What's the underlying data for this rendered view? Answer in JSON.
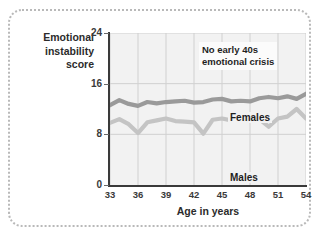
{
  "chart_data": {
    "type": "line",
    "title": "",
    "xlabel": "Age in years",
    "ylabel": "Emotional instability score",
    "ylabel_lines": [
      "Emotional",
      "instability",
      "score"
    ],
    "xlim": [
      33,
      54
    ],
    "ylim": [
      0,
      24
    ],
    "yticks": [
      0,
      8,
      16,
      24
    ],
    "xticks": [
      33,
      36,
      39,
      42,
      45,
      48,
      51,
      54
    ],
    "grid": "vertical-and-horizontal-light",
    "legend_position": "inline-labels",
    "annotations": [
      {
        "name": "no-early-40s-crisis",
        "text_lines": [
          "No early 40s",
          "emotional crisis"
        ],
        "text": "No early 40s emotional crisis"
      }
    ],
    "x": [
      33,
      34,
      35,
      36,
      37,
      38,
      39,
      40,
      41,
      42,
      43,
      44,
      45,
      46,
      47,
      48,
      49,
      50,
      51,
      52,
      53,
      54
    ],
    "series": [
      {
        "name": "Females",
        "label": "Females",
        "color": "#9a9a9a",
        "values": [
          12.6,
          13.4,
          12.8,
          12.5,
          13.1,
          12.9,
          13.1,
          13.2,
          13.3,
          13.0,
          13.1,
          13.5,
          13.6,
          13.2,
          13.3,
          13.2,
          13.7,
          13.9,
          13.7,
          14.0,
          13.6,
          14.4
        ]
      },
      {
        "name": "Males",
        "label": "Males",
        "color": "#c4c4c4",
        "values": [
          9.8,
          10.4,
          9.6,
          8.2,
          9.9,
          10.2,
          10.5,
          10.1,
          10.0,
          9.9,
          8.1,
          10.3,
          10.5,
          10.2,
          10.6,
          10.7,
          10.4,
          9.2,
          10.5,
          10.8,
          12.0,
          10.5
        ]
      }
    ],
    "colors": {
      "plot_background": "#f2f2f2",
      "axis": "#3a3a3a",
      "gridline": "#d0d0d0",
      "frame_border": "#b9b9b9",
      "females": "#9a9a9a",
      "males": "#c4c4c4"
    }
  }
}
